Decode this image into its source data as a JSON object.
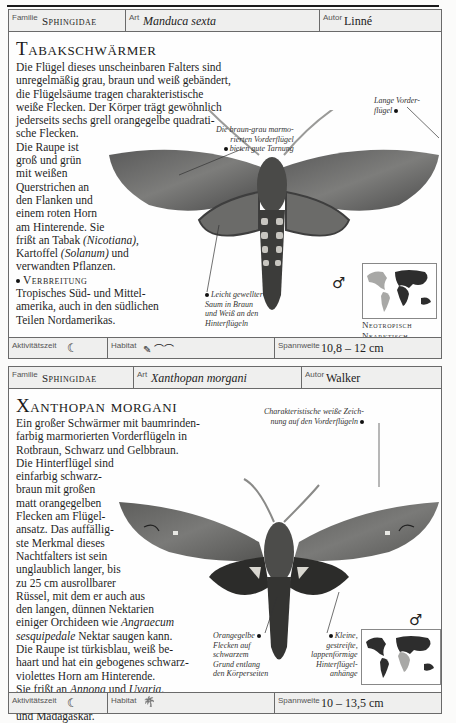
{
  "page_header": {
    "text": ""
  },
  "cards": [
    {
      "header": {
        "familie_label": "Familie",
        "familie_value": "Sphingidae",
        "art_label": "Art",
        "art_value": "Manduca sexta",
        "autor_label": "Autor",
        "autor_value": "Linné"
      },
      "title": "Tabakschwärmer",
      "body_lines": [
        "Die Flügel dieses unscheinbaren Falters sind",
        "unregelmäßig grau, braun und weiß gebändert,",
        "die Flügelsäume tragen charakteristische",
        "weiße Flecken. Der Körper trägt gewöhnlich",
        "jederseits sechs grell orangegelbe quadrati-",
        "sche Flecken.",
        "Die Raupe ist",
        "groß und grün",
        "mit weißen",
        "Querstrichen an",
        "den Flanken und",
        "einem roten Horn",
        "am Hinterende. Sie"
      ],
      "body_food_1": "frißt an Tabak ",
      "body_food_it1": "(Nicotiana),",
      "body_food_2": "Kartoffel ",
      "body_food_it2": "(Solanum)",
      "body_food_3": " und",
      "body_food_4": "verwandten Pflanzen.",
      "verbreitung_label": "Verbreitung",
      "verbreitung_lines": [
        "Tropisches Süd- und Mittel-",
        "amerika, auch in den südlichen",
        "Teilen Nordamerikas."
      ],
      "captions": {
        "c1": [
          "Die braun-grau marmo-",
          "rierten Vorderflügel",
          "bieten gute Tarnung"
        ],
        "c2": [
          "Lange Vorder-",
          "flügel"
        ],
        "c3": [
          "Leicht gewellter",
          "Saum in Braun",
          "und Weiß an den",
          "Hinterflügeln"
        ]
      },
      "sex_symbol": "♂",
      "region_lines": [
        "Neotropisch",
        "Nearktisch"
      ],
      "footer": {
        "aktiv_label": "Aktivitätszeit",
        "aktiv_icon": "☾",
        "habitat_label": "Habitat",
        "habitat_icons": "✎ ⌒⌒",
        "spann_label": "Spannweite",
        "spann_value": "10,8 – 12 cm"
      }
    },
    {
      "header": {
        "familie_label": "Familie",
        "familie_value": "Sphingidae",
        "art_label": "Art",
        "art_value": "Xanthopan morgani",
        "autor_label": "Autor",
        "autor_value": "Walker"
      },
      "title": "Xanthopan morgani",
      "body_lines": [
        "Ein großer Schwärmer mit baumrinden-",
        "farbig marmorierten Vorderflügeln in",
        "Rotbraun, Schwarz und Gelbbraun.",
        "Die Hinterflügel sind",
        "einfarbig schwarz-",
        "braun mit großen",
        "matt orangegelben",
        "Flecken am Flügel-",
        "ansatz. Das auffällig-",
        "ste Merkmal dieses",
        "Nachtfalters ist sein",
        "unglaublich langer, bis",
        "zu 25 cm ausrollbarer",
        "Rüssel, mit dem er auch aus",
        "den langen, dünnen Nektarien"
      ],
      "orch_1": "einiger Orchideen wie ",
      "orch_it1": "Angraecum",
      "orch_it2": "sesquipedale",
      "orch_2": " Nektar saugen kann.",
      "raupe_lines": [
        "Die Raupe ist türkisblau, weiß be-",
        "haart und hat ein gebogenes schwarz-",
        "violettes Horn am Hinterende."
      ],
      "food_1": "Sie frißt an ",
      "food_it1": "Annona",
      "food_2": " und ",
      "food_it2": "Uvaria",
      "food_3": ".",
      "verbreitung_label": "Verbreitung",
      "verbreitung_text": " Tropisches Afrika",
      "verbreitung_line2": "und Madagaskar.",
      "captions": {
        "c1": [
          "Charakteristische weiße Zeich-",
          "nung auf den Vorderflügeln"
        ],
        "c2": [
          "Orangegelbe",
          "Flecken auf",
          "schwarzem",
          "Grund entlang",
          "den Körperseiten"
        ],
        "c3": [
          "Kleine,",
          "gestreifte,",
          "lappenförmige",
          "Hinterflügel-",
          "anhänge"
        ]
      },
      "sex_symbol": "♂",
      "region_lines": [
        "Afroropisch"
      ],
      "footer": {
        "aktiv_label": "Aktivitätszeit",
        "aktiv_icon": "☾",
        "habitat_label": "Habitat",
        "habitat_icons": "🌴",
        "spann_label": "Spannweite",
        "spann_value": "10 – 13,5 cm"
      }
    }
  ]
}
